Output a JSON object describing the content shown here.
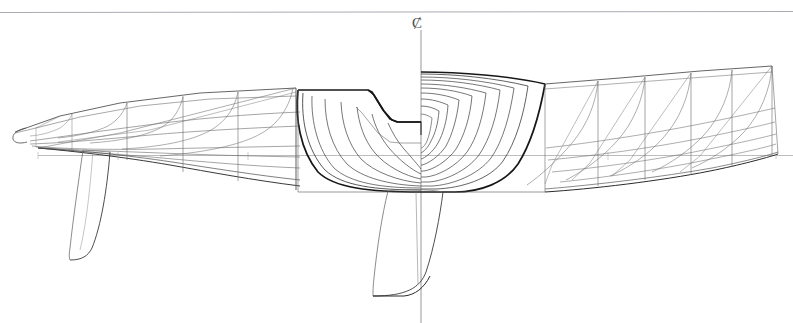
{
  "page": {
    "background_color": "#ffffff",
    "width": 793,
    "height": 323
  },
  "header": {
    "cropped_caption": "",
    "rule_color": "#aaaaaa"
  },
  "annotations": {
    "centerline_symbol": "Ȼ",
    "centerline_name": "centreline"
  },
  "drawing": {
    "type": "naval-architecture-lines-plan",
    "subject": "sailing yacht hull",
    "views": [
      {
        "name": "body-plan",
        "position": "center",
        "description": "transverse station sections, aft sections left of centreline, forward sections right of centreline"
      },
      {
        "name": "waterlines-plan-forward",
        "position": "left",
        "description": "waterlines and diagonals running forward to bow"
      },
      {
        "name": "waterlines-plan-aft",
        "position": "right",
        "description": "waterlines and diagonals running aft to transom"
      }
    ],
    "appendages": [
      {
        "name": "rudder",
        "position": "left-lower"
      },
      {
        "name": "fin-keel-with-bulb",
        "position": "center-lower"
      }
    ],
    "line_colors": {
      "hull_heavy": "#1a1a1a",
      "hull_medium": "#3a3a3a",
      "construction_light": "#8a8a8a",
      "datum": "#9a9a9a"
    },
    "stroke_widths": {
      "heavy": 1.6,
      "medium": 0.85,
      "light": 0.5
    },
    "reference_lines": {
      "top_rule_y": 12,
      "design_waterline_y": 155,
      "centreline_x": 421
    }
  }
}
